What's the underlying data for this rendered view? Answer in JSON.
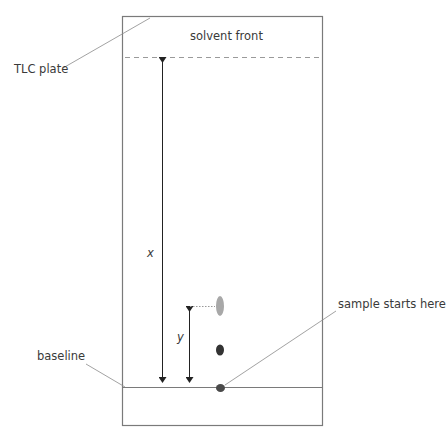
{
  "diagram": {
    "labels": {
      "solvent_front": "solvent front",
      "tlc_plate": "TLC plate",
      "x": "x",
      "y": "y",
      "baseline": "baseline",
      "sample_start": "sample starts here"
    },
    "spots": [
      {
        "name": "upper-spot",
        "shade": "light grey",
        "color": "#a8a8a8"
      },
      {
        "name": "middle-spot",
        "shade": "dark",
        "color": "#333333"
      },
      {
        "name": "start-spot",
        "shade": "dark grey",
        "color": "#4a4a4a"
      }
    ],
    "colors": {
      "plate_border": "#7a7a7a",
      "leader_line": "#8a8a8a",
      "arrow": "#222222",
      "dashed_front": "#9a9a9a"
    }
  }
}
